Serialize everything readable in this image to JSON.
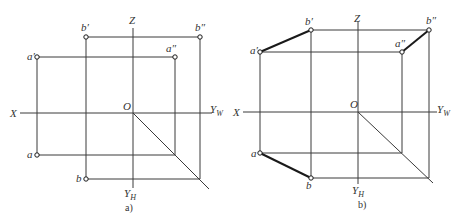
{
  "figure_a": {
    "caption": "a)",
    "axes": {
      "z": "Z",
      "x": "X",
      "yw": "Y",
      "yw_sub": "W",
      "yh": "Y",
      "yh_sub": "H",
      "origin": "O"
    },
    "points": {
      "b_prime": "b′",
      "b_dprime": "b″",
      "a_prime": "a′",
      "a_dprime": "a″",
      "a": "a",
      "b": "b"
    }
  },
  "figure_b": {
    "caption": "b)",
    "axes": {
      "z": "Z",
      "x": "X",
      "yw": "Y",
      "yw_sub": "W",
      "yh": "Y",
      "yh_sub": "H",
      "origin": "O"
    },
    "points": {
      "b_prime": "b′",
      "b_dprime": "b″",
      "a_prime": "a′",
      "a_dprime": "a″",
      "a": "a",
      "b": "b"
    }
  }
}
